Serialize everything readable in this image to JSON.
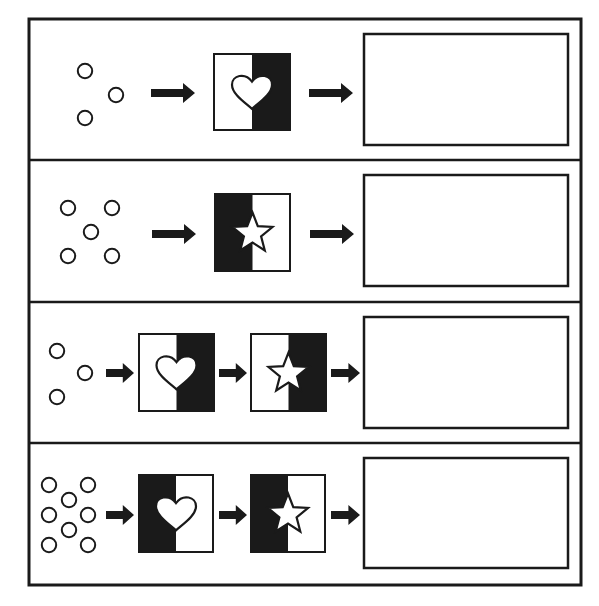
{
  "colors": {
    "ink": "#1a1a1a",
    "paper": "#ffffff"
  },
  "frame": {
    "x": 29,
    "y": 19,
    "w": 552,
    "h": 566
  },
  "dividers_y": [
    160,
    302,
    443
  ],
  "rows": [
    {
      "id": "row-1",
      "circles": [
        [
          85,
          71
        ],
        [
          116,
          95
        ],
        [
          85,
          118
        ]
      ],
      "arrows": [
        [
          151,
          93,
          195
        ]
      ],
      "cards": [
        {
          "shape": "heart",
          "x": 214,
          "y": 54,
          "w": 76,
          "h": 76,
          "black_side": "right"
        }
      ],
      "final_arrow": [
        309,
        93,
        353
      ],
      "result_box": {
        "x": 364,
        "y": 34,
        "w": 204,
        "h": 111,
        "content": ""
      }
    },
    {
      "id": "row-2",
      "circles": [
        [
          68,
          208
        ],
        [
          112,
          208
        ],
        [
          91,
          232
        ],
        [
          68,
          256
        ],
        [
          112,
          256
        ]
      ],
      "arrows": [
        [
          152,
          234,
          196
        ]
      ],
      "cards": [
        {
          "shape": "star",
          "x": 215,
          "y": 194,
          "w": 75,
          "h": 77,
          "black_side": "left"
        }
      ],
      "final_arrow": [
        310,
        234,
        354
      ],
      "result_box": {
        "x": 364,
        "y": 175,
        "w": 204,
        "h": 111,
        "content": ""
      }
    },
    {
      "id": "row-3",
      "circles": [
        [
          57,
          351
        ],
        [
          85,
          373
        ],
        [
          57,
          397
        ]
      ],
      "arrows": [
        [
          106,
          373,
          134
        ],
        [
          219,
          373,
          247
        ]
      ],
      "cards": [
        {
          "shape": "heart",
          "x": 139,
          "y": 334,
          "w": 75,
          "h": 77,
          "black_side": "right"
        },
        {
          "shape": "star",
          "x": 251,
          "y": 334,
          "w": 75,
          "h": 77,
          "black_side": "right"
        }
      ],
      "final_arrow": [
        331,
        373,
        360
      ],
      "result_box": {
        "x": 364,
        "y": 317,
        "w": 204,
        "h": 111,
        "content": ""
      }
    },
    {
      "id": "row-4",
      "circles": [
        [
          49,
          485
        ],
        [
          88,
          485
        ],
        [
          69,
          500
        ],
        [
          49,
          515
        ],
        [
          88,
          515
        ],
        [
          69,
          530
        ],
        [
          49,
          545
        ],
        [
          88,
          545
        ]
      ],
      "arrows": [
        [
          106,
          515,
          134
        ],
        [
          219,
          515,
          247
        ]
      ],
      "cards": [
        {
          "shape": "heart",
          "x": 139,
          "y": 475,
          "w": 74,
          "h": 77,
          "black_side": "left"
        },
        {
          "shape": "star",
          "x": 251,
          "y": 475,
          "w": 74,
          "h": 77,
          "black_side": "left"
        }
      ],
      "final_arrow": [
        331,
        515,
        360
      ],
      "result_box": {
        "x": 364,
        "y": 458,
        "w": 204,
        "h": 110,
        "content": ""
      }
    }
  ]
}
